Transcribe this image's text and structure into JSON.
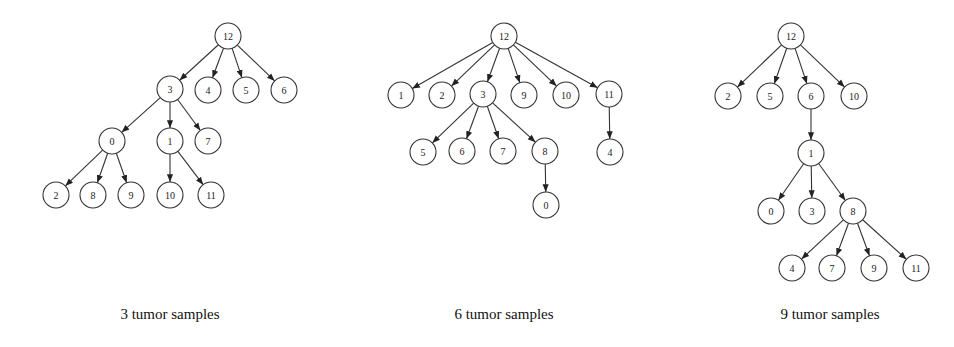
{
  "node_radius": 13,
  "trees": [
    {
      "caption": "3 tumor samples",
      "caption_x": 170,
      "nodes": [
        {
          "id": "12",
          "x": 228,
          "y": 36
        },
        {
          "id": "3",
          "x": 170,
          "y": 89
        },
        {
          "id": "4",
          "x": 208,
          "y": 90
        },
        {
          "id": "5",
          "x": 246,
          "y": 90
        },
        {
          "id": "6",
          "x": 284,
          "y": 90
        },
        {
          "id": "0",
          "x": 112,
          "y": 141
        },
        {
          "id": "1",
          "x": 170,
          "y": 141
        },
        {
          "id": "7",
          "x": 208,
          "y": 141
        },
        {
          "id": "2",
          "x": 56,
          "y": 195
        },
        {
          "id": "8",
          "x": 93,
          "y": 195
        },
        {
          "id": "9",
          "x": 131,
          "y": 195
        },
        {
          "id": "10",
          "x": 170,
          "y": 195
        },
        {
          "id": "11",
          "x": 211,
          "y": 195
        }
      ],
      "edges": [
        [
          "12",
          "3"
        ],
        [
          "12",
          "4"
        ],
        [
          "12",
          "5"
        ],
        [
          "12",
          "6"
        ],
        [
          "3",
          "0"
        ],
        [
          "3",
          "1"
        ],
        [
          "3",
          "7"
        ],
        [
          "0",
          "2"
        ],
        [
          "0",
          "8"
        ],
        [
          "0",
          "9"
        ],
        [
          "1",
          "10"
        ],
        [
          "1",
          "11"
        ]
      ]
    },
    {
      "caption": "6 tumor samples",
      "caption_x": 504,
      "nodes": [
        {
          "id": "12",
          "x": 504,
          "y": 36
        },
        {
          "id": "1",
          "x": 401,
          "y": 95
        },
        {
          "id": "2",
          "x": 442,
          "y": 95
        },
        {
          "id": "3",
          "x": 483,
          "y": 94
        },
        {
          "id": "9",
          "x": 524,
          "y": 95
        },
        {
          "id": "10",
          "x": 566,
          "y": 95
        },
        {
          "id": "11",
          "x": 609,
          "y": 94
        },
        {
          "id": "5",
          "x": 423,
          "y": 152
        },
        {
          "id": "6",
          "x": 462,
          "y": 151
        },
        {
          "id": "7",
          "x": 503,
          "y": 151
        },
        {
          "id": "8",
          "x": 545,
          "y": 151
        },
        {
          "id": "4",
          "x": 610,
          "y": 152
        },
        {
          "id": "0",
          "x": 546,
          "y": 205
        }
      ],
      "edges": [
        [
          "12",
          "1"
        ],
        [
          "12",
          "2"
        ],
        [
          "12",
          "3"
        ],
        [
          "12",
          "9"
        ],
        [
          "12",
          "10"
        ],
        [
          "12",
          "11"
        ],
        [
          "3",
          "5"
        ],
        [
          "3",
          "6"
        ],
        [
          "3",
          "7"
        ],
        [
          "3",
          "8"
        ],
        [
          "11",
          "4"
        ],
        [
          "8",
          "0"
        ]
      ]
    },
    {
      "caption": "9 tumor samples",
      "caption_x": 830,
      "nodes": [
        {
          "id": "12",
          "x": 791,
          "y": 36
        },
        {
          "id": "2",
          "x": 728,
          "y": 96
        },
        {
          "id": "5",
          "x": 770,
          "y": 96
        },
        {
          "id": "6",
          "x": 811,
          "y": 96
        },
        {
          "id": "10",
          "x": 854,
          "y": 96
        },
        {
          "id": "1",
          "x": 811,
          "y": 153
        },
        {
          "id": "0",
          "x": 771,
          "y": 211
        },
        {
          "id": "3",
          "x": 812,
          "y": 211
        },
        {
          "id": "8",
          "x": 853,
          "y": 211
        },
        {
          "id": "4",
          "x": 792,
          "y": 268
        },
        {
          "id": "7",
          "x": 832,
          "y": 268
        },
        {
          "id": "9",
          "x": 874,
          "y": 268
        },
        {
          "id": "11",
          "x": 916,
          "y": 268
        }
      ],
      "edges": [
        [
          "12",
          "2"
        ],
        [
          "12",
          "5"
        ],
        [
          "12",
          "6"
        ],
        [
          "12",
          "10"
        ],
        [
          "6",
          "1"
        ],
        [
          "1",
          "0"
        ],
        [
          "1",
          "3"
        ],
        [
          "1",
          "8"
        ],
        [
          "8",
          "4"
        ],
        [
          "8",
          "7"
        ],
        [
          "8",
          "9"
        ],
        [
          "8",
          "11"
        ]
      ]
    }
  ]
}
